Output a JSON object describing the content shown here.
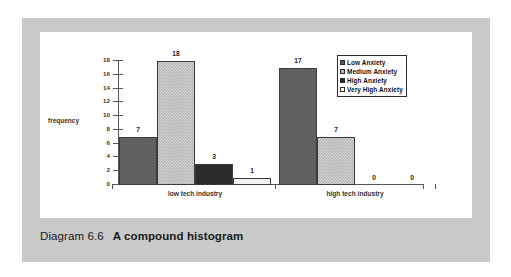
{
  "figure": {
    "caption_number": "Diagram 6.6",
    "caption_title": "A compound histogram",
    "panel_color": "#c9c9c9",
    "canvas_color": "#ffffff"
  },
  "chart_data": {
    "type": "bar",
    "title": "",
    "subtitle": "",
    "xlabel": "",
    "ylabel": "frequency",
    "ylim": [
      0,
      18
    ],
    "y_ticks": [
      0,
      2,
      4,
      6,
      8,
      10,
      12,
      14,
      16,
      18
    ],
    "y_tick_labels": [
      "0",
      "2",
      "4",
      "6",
      "8",
      "10",
      "12",
      "14",
      "16",
      "18"
    ],
    "grid": false,
    "legend_position": "top-right",
    "categories": [
      "low tech industry",
      "high tech industry"
    ],
    "series": [
      {
        "name": "Low Anxiety",
        "values": [
          7,
          17
        ],
        "color": "#5a5a5a",
        "pattern": "fill-low"
      },
      {
        "name": "Medium Anxiety",
        "values": [
          18,
          7
        ],
        "color": "#b6b6b6",
        "pattern": "fill-medium"
      },
      {
        "name": "High Anxiety",
        "values": [
          3,
          0
        ],
        "color": "#2a2a2a",
        "pattern": "fill-high"
      },
      {
        "name": "Very High Anxiety",
        "values": [
          1,
          0
        ],
        "color": "#f2f2f2",
        "pattern": "fill-veryhigh"
      }
    ],
    "data_labels": {
      "low tech industry": [
        "7",
        "18",
        "3",
        "1"
      ],
      "high tech industry": [
        "17",
        "7",
        "0",
        "0"
      ]
    }
  },
  "legend": {
    "items": [
      {
        "label": "Low Anxiety",
        "swatch": "#5a5a5a"
      },
      {
        "label": "Medium Anxiety",
        "swatch": "#b6b6b6"
      },
      {
        "label": "High Anxiety",
        "swatch": "#2a2a2a"
      },
      {
        "label": "Very High Anxiety",
        "swatch": "#ffffff"
      }
    ]
  }
}
